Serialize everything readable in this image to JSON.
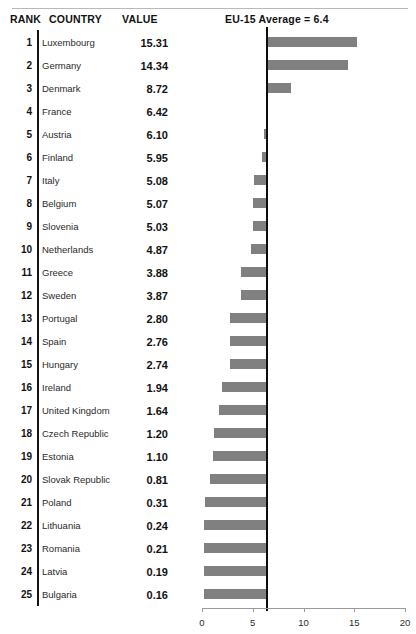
{
  "header": {
    "rank_label": "RANK",
    "country_label": "COUNTRY",
    "value_label": "VALUE",
    "average_label": "EU-15 Average = 6.4"
  },
  "reference": {
    "label": "EU-15 Average = 6.4",
    "value": 6.4
  },
  "colors": {
    "bar": "#808080",
    "reference_line": "#0d0d0d",
    "axis": "#9a9a9a",
    "text": "#111111",
    "top_rule": "#b9b9b9"
  },
  "chart_data": {
    "type": "bar",
    "title": "EU-15 Average = 6.4",
    "xlabel": "",
    "ylabel": "",
    "xlim": [
      0,
      20
    ],
    "xticks": [
      0,
      5,
      10,
      15,
      20
    ],
    "xtick_labels": [
      "0",
      "5",
      "10",
      "15",
      "20"
    ],
    "grid": false,
    "legend": "none",
    "orientation": "horizontal",
    "baseline": 6.4,
    "annotations": [
      "EU-15 Average = 6.4"
    ],
    "columns": [
      "RANK",
      "COUNTRY",
      "VALUE"
    ],
    "categories": [
      "Luxembourg",
      "Germany",
      "Denmark",
      "France",
      "Austria",
      "Finland",
      "Italy",
      "Belgium",
      "Slovenia",
      "Netherlands",
      "Greece",
      "Sweden",
      "Portugal",
      "Spain",
      "Hungary",
      "Ireland",
      "United Kingdom",
      "Czech Republic",
      "Estonia",
      "Slovak Republic",
      "Poland",
      "Lithuania",
      "Romania",
      "Latvia",
      "Bulgaria"
    ],
    "values": [
      15.31,
      14.34,
      8.72,
      6.42,
      6.1,
      5.95,
      5.08,
      5.07,
      5.03,
      4.87,
      3.88,
      3.87,
      2.8,
      2.76,
      2.74,
      1.94,
      1.64,
      1.2,
      1.1,
      0.81,
      0.31,
      0.24,
      0.21,
      0.19,
      0.16
    ]
  },
  "rows": [
    {
      "rank": "1",
      "country": "Luxembourg",
      "value": "15.31",
      "v": 15.31
    },
    {
      "rank": "2",
      "country": "Germany",
      "value": "14.34",
      "v": 14.34
    },
    {
      "rank": "3",
      "country": "Denmark",
      "value": "8.72",
      "v": 8.72
    },
    {
      "rank": "4",
      "country": "France",
      "value": "6.42",
      "v": 6.42
    },
    {
      "rank": "5",
      "country": "Austria",
      "value": "6.10",
      "v": 6.1
    },
    {
      "rank": "6",
      "country": "Finland",
      "value": "5.95",
      "v": 5.95
    },
    {
      "rank": "7",
      "country": "Italy",
      "value": "5.08",
      "v": 5.08
    },
    {
      "rank": "8",
      "country": "Belgium",
      "value": "5.07",
      "v": 5.07
    },
    {
      "rank": "9",
      "country": "Slovenia",
      "value": "5.03",
      "v": 5.03
    },
    {
      "rank": "10",
      "country": "Netherlands",
      "value": "4.87",
      "v": 4.87
    },
    {
      "rank": "11",
      "country": "Greece",
      "value": "3.88",
      "v": 3.88
    },
    {
      "rank": "12",
      "country": "Sweden",
      "value": "3.87",
      "v": 3.87
    },
    {
      "rank": "13",
      "country": "Portugal",
      "value": "2.80",
      "v": 2.8
    },
    {
      "rank": "14",
      "country": "Spain",
      "value": "2.76",
      "v": 2.76
    },
    {
      "rank": "15",
      "country": "Hungary",
      "value": "2.74",
      "v": 2.74
    },
    {
      "rank": "16",
      "country": "Ireland",
      "value": "1.94",
      "v": 1.94
    },
    {
      "rank": "17",
      "country": "United Kingdom",
      "value": "1.64",
      "v": 1.64
    },
    {
      "rank": "18",
      "country": "Czech Republic",
      "value": "1.20",
      "v": 1.2
    },
    {
      "rank": "19",
      "country": "Estonia",
      "value": "1.10",
      "v": 1.1
    },
    {
      "rank": "20",
      "country": "Slovak Republic",
      "value": "0.81",
      "v": 0.81
    },
    {
      "rank": "21",
      "country": "Poland",
      "value": "0.31",
      "v": 0.31
    },
    {
      "rank": "22",
      "country": "Lithuania",
      "value": "0.24",
      "v": 0.24
    },
    {
      "rank": "23",
      "country": "Romania",
      "value": "0.21",
      "v": 0.21
    },
    {
      "rank": "24",
      "country": "Latvia",
      "value": "0.19",
      "v": 0.19
    },
    {
      "rank": "25",
      "country": "Bulgaria",
      "value": "0.16",
      "v": 0.16
    }
  ],
  "axis": {
    "ticks": [
      "0",
      "5",
      "10",
      "15",
      "20"
    ]
  }
}
